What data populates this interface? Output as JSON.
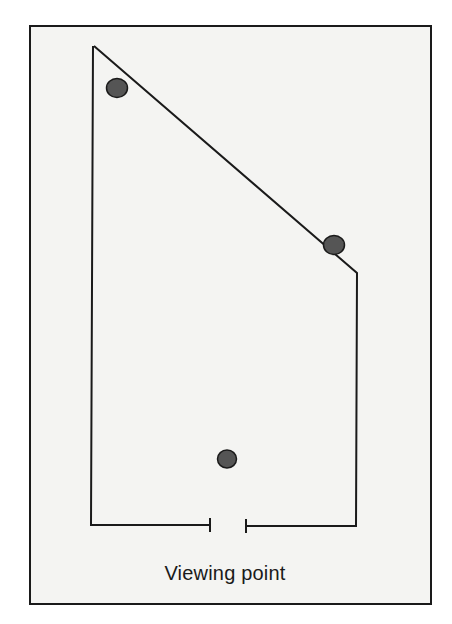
{
  "figure": {
    "background_color": "#f4f4f2",
    "line_color": "#1a1a1a",
    "dot_color": "#4a4a4a",
    "frame": {
      "x": 30,
      "y": 27,
      "width": 401,
      "height": 578
    },
    "room_outline": {
      "points": [
        [
          94,
          40
        ],
        [
          357,
          230
        ],
        [
          356,
          526
        ],
        [
          246,
          526
        ]
      ],
      "left_points": [
        [
          210,
          525
        ],
        [
          91,
          525
        ],
        [
          93,
          40
        ]
      ],
      "doorway": {
        "left_tick_x": 210,
        "right_tick_x": 246,
        "y": 526,
        "tick_half_height": 7
      }
    },
    "dots": [
      {
        "name": "dot-upper-left",
        "cx": 117,
        "cy": 88,
        "r": 11
      },
      {
        "name": "dot-right",
        "cx": 334,
        "cy": 245,
        "r": 11
      },
      {
        "name": "viewing-point-dot",
        "cx": 227,
        "cy": 459,
        "r": 11
      }
    ],
    "label": "Viewing point"
  }
}
